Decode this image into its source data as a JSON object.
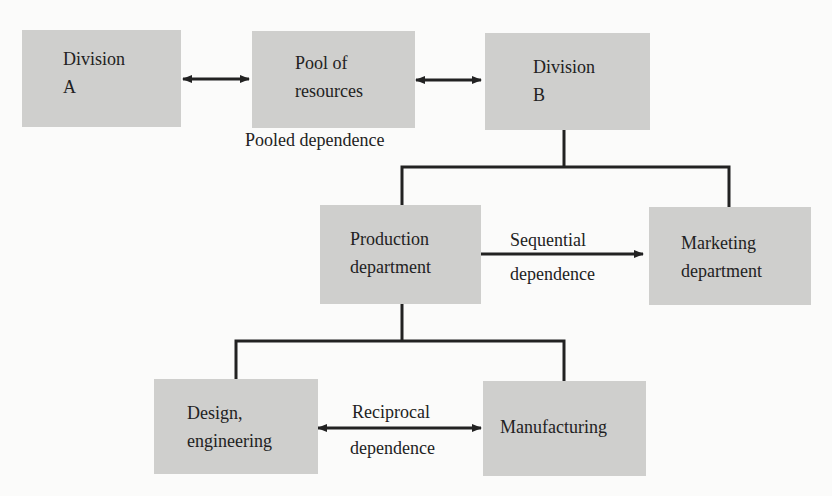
{
  "diagram": {
    "type": "organizational-interdependence",
    "nodes": {
      "division_a": {
        "line1": "Division",
        "line2": "A"
      },
      "pool": {
        "line1": "Pool of",
        "line2": "resources"
      },
      "division_b": {
        "line1": "Division",
        "line2": "B"
      },
      "production": {
        "line1": "Production",
        "line2": "department"
      },
      "marketing": {
        "line1": "Marketing",
        "line2": "department"
      },
      "design": {
        "line1": "Design,",
        "line2": "engineering"
      },
      "manufacturing": {
        "line1": "Manufacturing"
      }
    },
    "labels": {
      "pooled": "Pooled dependence",
      "sequential_1": "Sequential",
      "sequential_2": "dependence",
      "reciprocal_1": "Reciprocal",
      "reciprocal_2": "dependence"
    },
    "edges": [
      {
        "from": "division_a",
        "to": "pool",
        "type": "bidirectional"
      },
      {
        "from": "pool",
        "to": "division_b",
        "type": "bidirectional"
      },
      {
        "from": "division_b",
        "to": "production",
        "type": "hierarchy"
      },
      {
        "from": "division_b",
        "to": "marketing",
        "type": "hierarchy"
      },
      {
        "from": "production",
        "to": "marketing",
        "type": "directional"
      },
      {
        "from": "production",
        "to": "design",
        "type": "hierarchy"
      },
      {
        "from": "production",
        "to": "manufacturing",
        "type": "hierarchy"
      },
      {
        "from": "design",
        "to": "manufacturing",
        "type": "bidirectional"
      }
    ],
    "colors": {
      "box": "#cfcfcd",
      "line": "#222222",
      "background": "#fbfbfa"
    }
  }
}
